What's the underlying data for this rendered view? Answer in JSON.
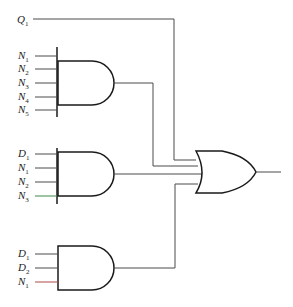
{
  "diagram": {
    "type": "logic-circuit",
    "signals": {
      "q1": {
        "letter": "Q",
        "sub": "1"
      }
    },
    "gates": [
      {
        "id": "and-top",
        "type": "AND",
        "inputs": [
          {
            "letter": "N",
            "sub": "1"
          },
          {
            "letter": "N",
            "sub": "2"
          },
          {
            "letter": "N",
            "sub": "3"
          },
          {
            "letter": "N",
            "sub": "4"
          },
          {
            "letter": "N",
            "sub": "5"
          }
        ]
      },
      {
        "id": "and-middle",
        "type": "AND",
        "inputs": [
          {
            "letter": "D",
            "sub": "1"
          },
          {
            "letter": "N",
            "sub": "1"
          },
          {
            "letter": "N",
            "sub": "2"
          },
          {
            "letter": "N",
            "sub": "3"
          }
        ]
      },
      {
        "id": "and-bottom",
        "type": "AND",
        "inputs": [
          {
            "letter": "D",
            "sub": "1"
          },
          {
            "letter": "D",
            "sub": "2"
          },
          {
            "letter": "N",
            "sub": "1"
          }
        ]
      },
      {
        "id": "or-output",
        "type": "OR",
        "inputs": [
          "Q1",
          "and-top",
          "and-middle",
          "and-bottom"
        ]
      }
    ]
  }
}
